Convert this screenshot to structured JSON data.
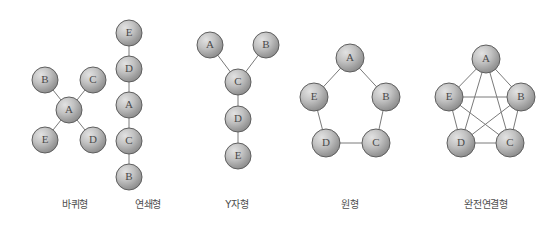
{
  "figure": {
    "background_color": "#ffffff",
    "node_fill_light": "#d4d4d4",
    "node_fill_dark": "#8d8d8d",
    "node_stroke_color": "#5e5e5e",
    "edge_color": "#7a7a7a",
    "label_color": "#4a4a4a",
    "caption_color": "#4d4d4d"
  },
  "networks": [
    {
      "id": "wheel",
      "caption": "바퀴형",
      "caption_x": 75,
      "caption_y": 196,
      "node_radius": 13,
      "nodes": [
        {
          "label": "B",
          "x": 45,
          "y": 80
        },
        {
          "label": "C",
          "x": 93,
          "y": 80
        },
        {
          "label": "A",
          "x": 69,
          "y": 110
        },
        {
          "label": "E",
          "x": 45,
          "y": 140
        },
        {
          "label": "D",
          "x": 93,
          "y": 140
        }
      ],
      "edges": [
        {
          "from": "A",
          "to": "B"
        },
        {
          "from": "A",
          "to": "C"
        },
        {
          "from": "A",
          "to": "D"
        },
        {
          "from": "A",
          "to": "E"
        }
      ]
    },
    {
      "id": "chain",
      "caption": "연쇄형",
      "caption_x": 148,
      "caption_y": 196,
      "node_radius": 13,
      "nodes": [
        {
          "label": "E",
          "x": 129,
          "y": 33
        },
        {
          "label": "D",
          "x": 129,
          "y": 69
        },
        {
          "label": "A",
          "x": 129,
          "y": 105
        },
        {
          "label": "C",
          "x": 129,
          "y": 141
        },
        {
          "label": "B",
          "x": 129,
          "y": 177
        }
      ],
      "edges": [
        {
          "from": "E",
          "to": "D"
        },
        {
          "from": "D",
          "to": "A"
        },
        {
          "from": "A",
          "to": "C"
        },
        {
          "from": "C",
          "to": "B"
        }
      ]
    },
    {
      "id": "y-shape",
      "caption": "Y자형",
      "caption_x": 237,
      "caption_y": 196,
      "node_radius": 13,
      "nodes": [
        {
          "label": "A",
          "x": 210,
          "y": 45
        },
        {
          "label": "B",
          "x": 266,
          "y": 45
        },
        {
          "label": "C",
          "x": 238,
          "y": 82
        },
        {
          "label": "D",
          "x": 238,
          "y": 119
        },
        {
          "label": "E",
          "x": 238,
          "y": 156
        }
      ],
      "edges": [
        {
          "from": "A",
          "to": "C"
        },
        {
          "from": "B",
          "to": "C"
        },
        {
          "from": "C",
          "to": "D"
        },
        {
          "from": "D",
          "to": "E"
        }
      ]
    },
    {
      "id": "circle",
      "caption": "원형",
      "caption_x": 350,
      "caption_y": 196,
      "node_radius": 14,
      "nodes": [
        {
          "label": "A",
          "x": 350,
          "y": 58
        },
        {
          "label": "B",
          "x": 386,
          "y": 97
        },
        {
          "label": "C",
          "x": 376,
          "y": 143
        },
        {
          "label": "D",
          "x": 326,
          "y": 143
        },
        {
          "label": "E",
          "x": 314,
          "y": 97
        }
      ],
      "edges": [
        {
          "from": "A",
          "to": "B"
        },
        {
          "from": "B",
          "to": "C"
        },
        {
          "from": "C",
          "to": "D"
        },
        {
          "from": "D",
          "to": "E"
        },
        {
          "from": "E",
          "to": "A"
        }
      ]
    },
    {
      "id": "all-channel",
      "caption": "완전연결형",
      "caption_x": 486,
      "caption_y": 196,
      "node_radius": 14,
      "nodes": [
        {
          "label": "A",
          "x": 486,
          "y": 59
        },
        {
          "label": "B",
          "x": 521,
          "y": 97
        },
        {
          "label": "C",
          "x": 510,
          "y": 143
        },
        {
          "label": "D",
          "x": 461,
          "y": 143
        },
        {
          "label": "E",
          "x": 449,
          "y": 97
        }
      ],
      "edges": [
        {
          "from": "A",
          "to": "B"
        },
        {
          "from": "A",
          "to": "C"
        },
        {
          "from": "A",
          "to": "D"
        },
        {
          "from": "A",
          "to": "E"
        },
        {
          "from": "B",
          "to": "C"
        },
        {
          "from": "B",
          "to": "D"
        },
        {
          "from": "B",
          "to": "E"
        },
        {
          "from": "C",
          "to": "D"
        },
        {
          "from": "C",
          "to": "E"
        },
        {
          "from": "D",
          "to": "E"
        }
      ]
    }
  ]
}
